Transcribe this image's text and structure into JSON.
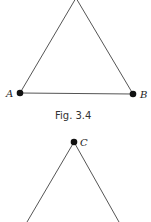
{
  "figure_top": {
    "caption": "Fig. 3.4",
    "points": {
      "A": {
        "label": "A",
        "x": 20,
        "y": 93
      },
      "B": {
        "label": "B",
        "x": 133,
        "y": 94
      },
      "apex": {
        "x": 76,
        "y": 0
      }
    }
  },
  "figure_bottom": {
    "points": {
      "C": {
        "label": "C",
        "x": 74,
        "y": 142
      },
      "left_end": {
        "x": 27,
        "y": 222
      },
      "right_end": {
        "x": 119,
        "y": 222
      }
    }
  },
  "colors": {
    "line": "#555555",
    "point": "#111111",
    "background": "#ffffff"
  }
}
